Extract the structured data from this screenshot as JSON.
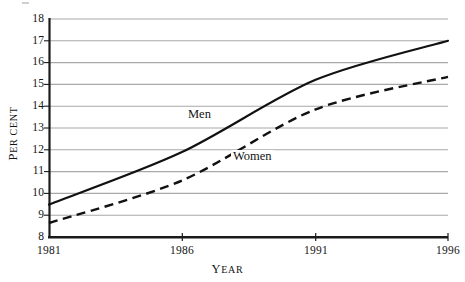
{
  "chart_data": {
    "type": "line",
    "title": "",
    "xlabel": "Year",
    "ylabel": "Per cent",
    "x": [
      1981,
      1986,
      1991,
      1996
    ],
    "xlim": [
      1981,
      1996
    ],
    "ylim": [
      8,
      18
    ],
    "xticks": [
      "1981",
      "1986",
      "1991",
      "1996"
    ],
    "yticks": [
      "8",
      "9",
      "10",
      "11",
      "12",
      "13",
      "14",
      "15",
      "16",
      "17",
      "18"
    ],
    "grid": true,
    "legend_position": "inline-annotation",
    "series": [
      {
        "name": "Men",
        "style": "solid",
        "color": "#111111",
        "values": [
          9.5,
          11.9,
          15.2,
          17.0
        ]
      },
      {
        "name": "Women",
        "style": "dashed",
        "color": "#111111",
        "values": [
          8.65,
          10.6,
          13.85,
          15.35
        ]
      }
    ],
    "annotations": [
      {
        "text": "Men",
        "x": 1987.4,
        "y": 13.45
      },
      {
        "text": "Women",
        "x": 1989.2,
        "y": 11.75
      }
    ]
  },
  "axes": {
    "y_title_first": "P",
    "y_title_rest": "ER CENT",
    "x_title_first": "Y",
    "x_title_rest": "EAR"
  },
  "colors": {
    "gridline": "#a8a8a8",
    "axis": "#1a1a1a",
    "series": "#111111",
    "background": "#ffffff"
  }
}
